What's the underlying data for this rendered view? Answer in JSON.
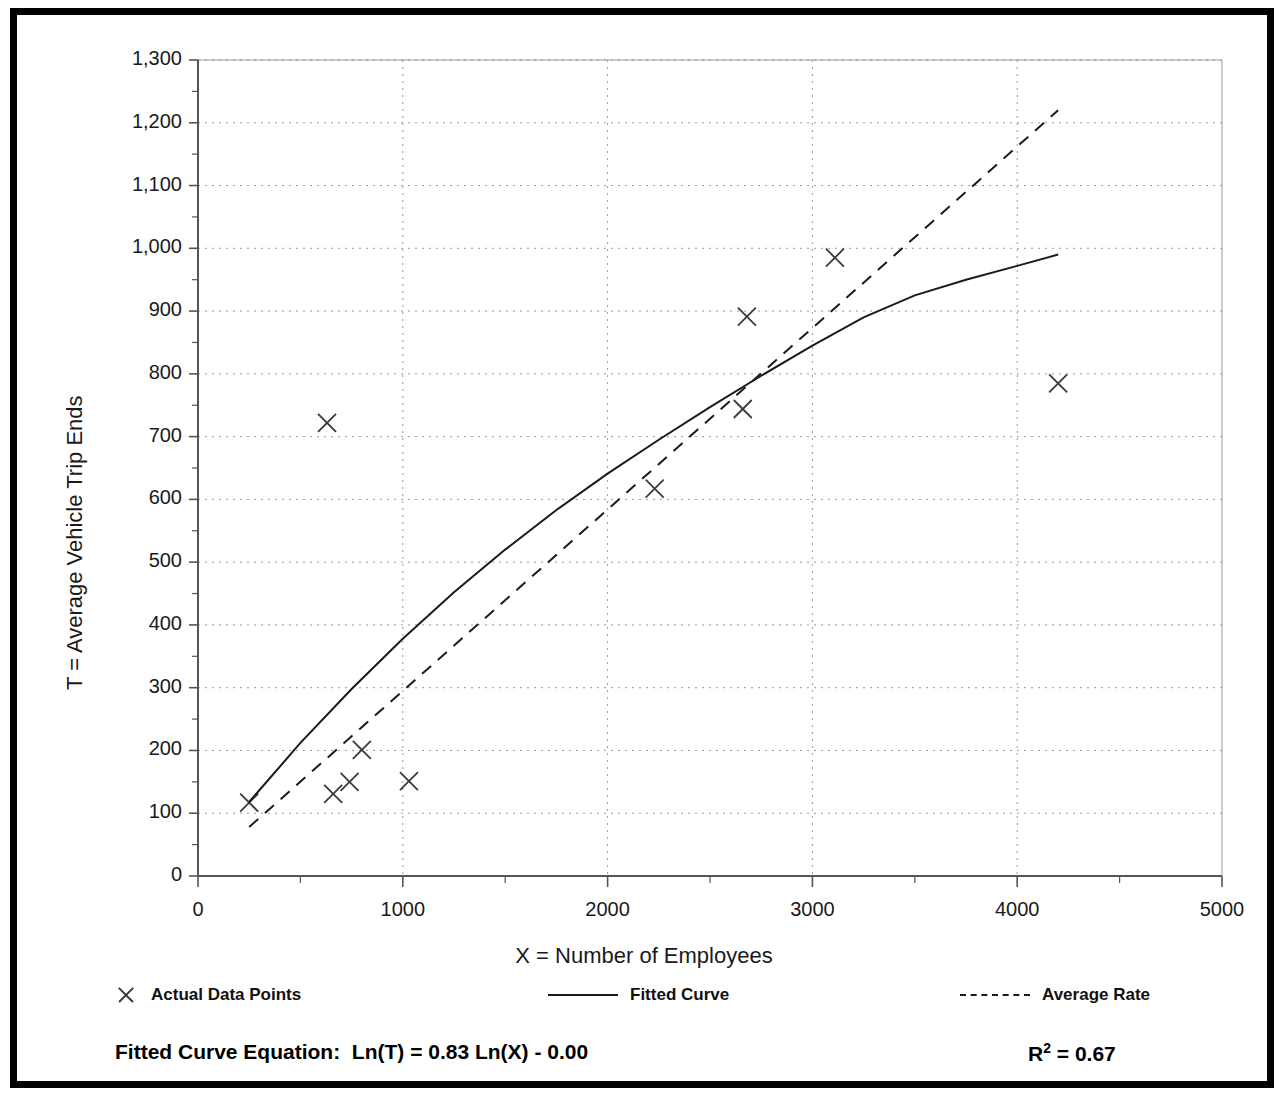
{
  "chart_data": {
    "type": "scatter",
    "title": "",
    "xlabel": "X = Number of Employees",
    "ylabel": "T = Average Vehicle Trip Ends",
    "xlim": [
      0,
      5000
    ],
    "ylim": [
      0,
      1300
    ],
    "xticks": [
      0,
      1000,
      2000,
      3000,
      4000,
      5000
    ],
    "xtick_labels": [
      "0",
      "1000",
      "2000",
      "3000",
      "4000",
      "5000"
    ],
    "yticks": [
      0,
      100,
      200,
      300,
      400,
      500,
      600,
      700,
      800,
      900,
      1000,
      1100,
      1200,
      1300
    ],
    "ytick_labels": [
      "0",
      "100",
      "200",
      "300",
      "400",
      "500",
      "600",
      "700",
      "800",
      "900",
      "1,000",
      "1,100",
      "1,200",
      "1,300"
    ],
    "x_minor_tick_step": 500,
    "y_minor_tick_step": 50,
    "grid": "dotted-both-axes",
    "legend_position": "below-axes",
    "series": [
      {
        "name": "Actual Data Points",
        "type": "scatter",
        "marker": "x",
        "points": [
          [
            250,
            117
          ],
          [
            630,
            722
          ],
          [
            660,
            131
          ],
          [
            740,
            150
          ],
          [
            800,
            201
          ],
          [
            1030,
            151
          ],
          [
            2230,
            617
          ],
          [
            2660,
            744
          ],
          [
            2680,
            891
          ],
          [
            3110,
            985
          ],
          [
            4200,
            785
          ]
        ]
      },
      {
        "name": "Fitted Curve",
        "type": "line",
        "style": "solid",
        "points": [
          [
            250,
            118
          ],
          [
            500,
            213
          ],
          [
            750,
            300
          ],
          [
            1000,
            382
          ],
          [
            1250,
            460
          ],
          [
            1500,
            535
          ],
          [
            1750,
            608
          ],
          [
            2000,
            678
          ],
          [
            2250,
            746
          ],
          [
            2500,
            813
          ],
          [
            2750,
            878
          ],
          [
            3000,
            942
          ],
          [
            3250,
            1005
          ],
          [
            3500,
            1067
          ],
          [
            3750,
            1128
          ],
          [
            4000,
            1188
          ],
          [
            4200,
            1235
          ]
        ],
        "render_points": [
          [
            250,
            118
          ],
          [
            500,
            212
          ],
          [
            750,
            298
          ],
          [
            1000,
            378
          ],
          [
            1250,
            452
          ],
          [
            1500,
            520
          ],
          [
            1750,
            583
          ],
          [
            2000,
            641
          ],
          [
            2250,
            695
          ],
          [
            2500,
            747
          ],
          [
            2750,
            797
          ],
          [
            3000,
            845
          ],
          [
            3250,
            890
          ],
          [
            3500,
            925
          ],
          [
            3750,
            950
          ],
          [
            4000,
            972
          ],
          [
            4200,
            990
          ]
        ]
      },
      {
        "name": "Average Rate",
        "type": "line",
        "style": "dashed",
        "points": [
          [
            250,
            78
          ],
          [
            4200,
            1220
          ]
        ]
      }
    ],
    "annotations": [
      {
        "name": "fitted-curve-equation",
        "text": "Fitted Curve Equation:  Ln(T) = 0.83 Ln(X) - 0.00"
      },
      {
        "name": "r-squared",
        "text_base": "R",
        "text_sup": "2",
        "text_tail": " = 0.67"
      }
    ]
  },
  "legend": {
    "items": [
      {
        "label": "Actual Data Points",
        "swatch": "marker-x"
      },
      {
        "label": "Fitted Curve",
        "swatch": "solid-line"
      },
      {
        "label": "Average Rate",
        "swatch": "dashed-line"
      }
    ]
  },
  "footnote": {
    "equation": "Fitted Curve Equation:  Ln(T) = 0.83 Ln(X) - 0.00",
    "r_squared_base": "R",
    "r_squared_sup": "2",
    "r_squared_tail": " = 0.67"
  },
  "colors": {
    "frame": "#000000",
    "axis": "#555555",
    "grid": "#999999",
    "marker": "#3a3a3a",
    "line": "#1a1a1a",
    "text": "#111111",
    "background": "#ffffff"
  }
}
